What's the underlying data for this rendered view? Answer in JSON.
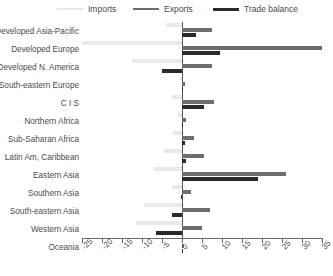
{
  "legend": {
    "items": [
      {
        "label": "Imports",
        "color": "#e9e9e9",
        "icon": "line-swatch-icon"
      },
      {
        "label": "Exports",
        "color": "#6e6e6e",
        "icon": "line-swatch-icon"
      },
      {
        "label": "Trade balance",
        "color": "#2b2b2b",
        "icon": "line-swatch-icon"
      }
    ]
  },
  "chart_data": {
    "type": "bar",
    "orientation": "horizontal",
    "title": "",
    "subtitle": "",
    "xlabel": "",
    "ylabel": "",
    "xlim": [
      -25,
      35
    ],
    "xticks": [
      -25,
      -20,
      -15,
      -10,
      -5,
      0,
      5,
      10,
      15,
      20,
      25,
      30,
      35
    ],
    "xticklabels": [
      "-25",
      "-20",
      "-15",
      "-10",
      "-5",
      "0",
      "5",
      "10",
      "15",
      "20",
      "25",
      "30",
      "35"
    ],
    "grid": false,
    "legend_position": "top",
    "categories": [
      "Developed Asia-Pacific",
      "Developed Europe",
      "Developed N. America",
      "South-eastern Europe",
      "C I S",
      "Northern Africa",
      "Sub-Saharan Africa",
      "Latin Am, Caribbean",
      "Eastern Asia",
      "Southern Asia",
      "South-eastern Asia",
      "Western Asia",
      "Oceania"
    ],
    "series": [
      {
        "name": "Imports",
        "color": "#e9e9e9",
        "values": [
          -4.0,
          -25.0,
          -12.5,
          -0.6,
          -2.4,
          -1.0,
          -2.3,
          -4.5,
          -7.0,
          -2.5,
          -9.5,
          -11.5,
          -0.3
        ]
      },
      {
        "name": "Exports",
        "color": "#6e6e6e",
        "values": [
          7.5,
          35.0,
          7.5,
          0.8,
          8.0,
          1.0,
          3.0,
          5.5,
          26.0,
          2.2,
          7.0,
          5.0,
          0.4
        ]
      },
      {
        "name": "Trade balance",
        "color": "#2b2b2b",
        "values": [
          3.5,
          9.5,
          -5.0,
          0.2,
          5.6,
          0.0,
          0.7,
          1.0,
          19.0,
          -0.3,
          -2.5,
          -6.5,
          0.1
        ]
      }
    ]
  }
}
